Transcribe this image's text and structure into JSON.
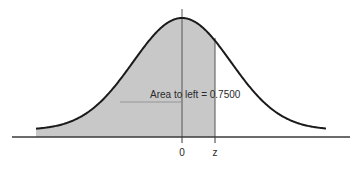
{
  "chart_data": {
    "type": "area",
    "title": "",
    "xlabel": "",
    "ylabel": "",
    "distribution": "standard normal",
    "shaded_region": "left of z",
    "annotation": "Area to left = 0.7500",
    "area_to_left": 0.75,
    "x_ticks": [
      "0",
      "z"
    ],
    "x_tick_values": [
      0,
      0.6745
    ],
    "xlim": [
      -3.5,
      3.5
    ],
    "grid": false,
    "legend": null
  },
  "colors": {
    "shade": "#c8c8c8",
    "curve": "#1a1a1a",
    "axis": "#3a3a3a",
    "background": "#ffffff"
  }
}
